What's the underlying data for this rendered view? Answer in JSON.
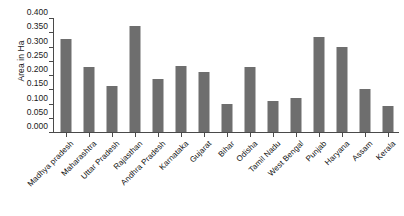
{
  "chart_data": {
    "type": "bar",
    "title": "",
    "subtitle": "",
    "xlabel": "",
    "ylabel": "Area in Ha",
    "ylim": [
      0.0,
      0.4
    ],
    "yticks": [
      "0.000",
      "0.050",
      "0.100",
      "0.150",
      "0.200",
      "0.250",
      "0.300",
      "0.350",
      "0.400"
    ],
    "ytick_values": [
      0.0,
      0.05,
      0.1,
      0.15,
      0.2,
      0.25,
      0.3,
      0.35,
      0.4
    ],
    "grid": false,
    "legend": false,
    "bar_color": "#6e6e6e",
    "axis_color": "#4a4a4a",
    "categories": [
      "Madhya pradesh",
      "Maharashtra",
      "Uttar Pradesh",
      "Rajasthan",
      "Andhra Pradesh",
      "Karnataka",
      "Gujarat",
      "Bihar",
      "Odisha",
      "Tamil Nadu",
      "West Bengal",
      "Punjab",
      "Haryana",
      "Assam",
      "Kerala"
    ],
    "values": [
      0.325,
      0.228,
      0.16,
      0.372,
      0.185,
      0.232,
      0.212,
      0.097,
      0.228,
      0.11,
      0.12,
      0.335,
      0.3,
      0.152,
      0.092
    ]
  }
}
